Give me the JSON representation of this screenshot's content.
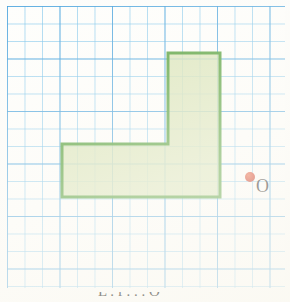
{
  "figure": {
    "background_color": "#fdfdfb"
  },
  "grid": {
    "name": "graph-paper-grid",
    "cell_size_px": 17.5,
    "major_every": 3,
    "minor_line_color": "#78c3eb",
    "major_line_color": "#46a0dc",
    "origin_x_px": 7,
    "origin_y_px": 6,
    "width_px": 278,
    "height_px": 282,
    "columns": 16,
    "rows": 16
  },
  "shape": {
    "name": "l-shaped-polygon",
    "label": "L",
    "stroke_color": "#4e9c34",
    "fill_color": "#cbdba6",
    "stroke_width_px": 3,
    "vertices_px": [
      [
        168,
        53
      ],
      [
        220,
        53
      ],
      [
        220,
        197
      ],
      [
        62,
        197
      ],
      [
        62,
        144
      ],
      [
        168,
        144
      ]
    ],
    "vertices_cells": [
      [
        9.2,
        2.7
      ],
      [
        12.2,
        2.7
      ],
      [
        12.2,
        10.9
      ],
      [
        3.1,
        10.9
      ],
      [
        3.1,
        7.9
      ],
      [
        9.2,
        7.9
      ]
    ],
    "vertical_arm_cells": {
      "width": 3,
      "height": 8
    },
    "horizontal_arm_cells": {
      "width": 9,
      "height": 3
    },
    "area_cells": 9
  },
  "point": {
    "name": "point-o",
    "label": "O",
    "dot_color": "#d0341c",
    "label_color": "#12100f",
    "x_px": 250,
    "y_px": 177
  },
  "caption": {
    "text": "L . f . . . O"
  }
}
